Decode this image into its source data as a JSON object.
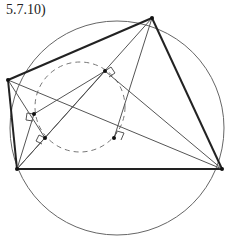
{
  "figure": {
    "label": "5.7.10)"
  },
  "colors": {
    "thick_line": "#222222",
    "thin_line": "#555555",
    "circle": "#666666",
    "dashed_circle": "#777777",
    "point": "#111111"
  }
}
